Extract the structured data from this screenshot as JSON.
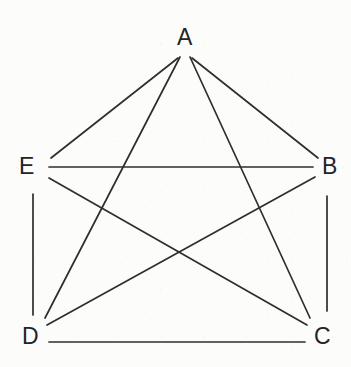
{
  "figure": {
    "background_color": "#fcfcfa",
    "edge_color": "#2e2e30",
    "label_color": "#242426",
    "edge_width": 1.7,
    "width": 351,
    "height": 367
  },
  "chart_data": {
    "type": "diagram",
    "graph_type": "complete-graph",
    "notation": "K5",
    "title": "",
    "directed": false,
    "weighted": false,
    "vertex_count": 5,
    "edge_count": 10,
    "nodes": [
      {
        "id": "A",
        "label": "A",
        "x": 185,
        "y": 38,
        "label_x": 177,
        "label_y": 26,
        "anchor_x": 185,
        "anchor_y": 57
      },
      {
        "id": "B",
        "label": "B",
        "x": 327,
        "y": 167,
        "label_x": 322,
        "label_y": 155,
        "anchor_x": 313,
        "anchor_y": 167
      },
      {
        "id": "C",
        "label": "C",
        "x": 327,
        "y": 337,
        "label_x": 314,
        "label_y": 325,
        "anchor_x": 314,
        "anchor_y": 325
      },
      {
        "id": "D",
        "label": "D",
        "x": 33,
        "y": 337,
        "label_x": 22,
        "label_y": 325,
        "anchor_x": 49,
        "anchor_y": 325
      },
      {
        "id": "E",
        "label": "E",
        "x": 33,
        "y": 167,
        "label_x": 19,
        "label_y": 155,
        "anchor_x": 49,
        "anchor_y": 167
      }
    ],
    "edges": [
      {
        "id": "AB",
        "from": "A",
        "to": "B",
        "x1": 192,
        "y1": 58,
        "x2": 318,
        "y2": 158
      },
      {
        "id": "AC",
        "from": "A",
        "to": "C",
        "x1": 190,
        "y1": 57,
        "x2": 310,
        "y2": 318
      },
      {
        "id": "AD",
        "from": "A",
        "to": "D",
        "x1": 180,
        "y1": 57,
        "x2": 45,
        "y2": 318
      },
      {
        "id": "AE",
        "from": "A",
        "to": "E",
        "x1": 178,
        "y1": 58,
        "x2": 51,
        "y2": 158
      },
      {
        "id": "BC",
        "from": "B",
        "to": "C",
        "x1": 327,
        "y1": 196,
        "x2": 327,
        "y2": 311
      },
      {
        "id": "BD",
        "from": "B",
        "to": "D",
        "x1": 315,
        "y1": 177,
        "x2": 47,
        "y2": 325
      },
      {
        "id": "BE",
        "from": "B",
        "to": "E",
        "x1": 313,
        "y1": 167,
        "x2": 49,
        "y2": 167
      },
      {
        "id": "CD",
        "from": "C",
        "to": "D",
        "x1": 305,
        "y1": 342,
        "x2": 49,
        "y2": 342
      },
      {
        "id": "CE",
        "from": "C",
        "to": "E",
        "x1": 307,
        "y1": 325,
        "x2": 49,
        "y2": 178
      },
      {
        "id": "DE",
        "from": "D",
        "to": "E",
        "x1": 33,
        "y1": 315,
        "x2": 33,
        "y2": 194
      }
    ],
    "crossings": [
      {
        "edges": [
          "CE",
          "BD"
        ],
        "x": 185,
        "y": 252
      },
      {
        "edges": [
          "AD",
          "BE"
        ],
        "x": 120,
        "y": 167
      },
      {
        "edges": [
          "AC",
          "BE"
        ],
        "x": 245,
        "y": 167
      },
      {
        "edges": [
          "AC",
          "BD"
        ],
        "x": 265,
        "y": 188
      },
      {
        "edges": [
          "AD",
          "CE"
        ],
        "x": 107,
        "y": 199
      }
    ]
  }
}
